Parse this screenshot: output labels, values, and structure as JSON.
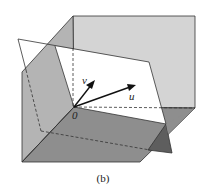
{
  "figure": {
    "caption": "(b)",
    "labels": {
      "v": "v",
      "u": "u",
      "origin": "0"
    },
    "colors": {
      "back_face": "#d4d4d4",
      "left_face": "#b4b4b4",
      "bottom_face": "#8c8c8c",
      "dark_wedge": "#6a6a6a",
      "plane": "#ffffff",
      "stroke": "#222222"
    }
  }
}
